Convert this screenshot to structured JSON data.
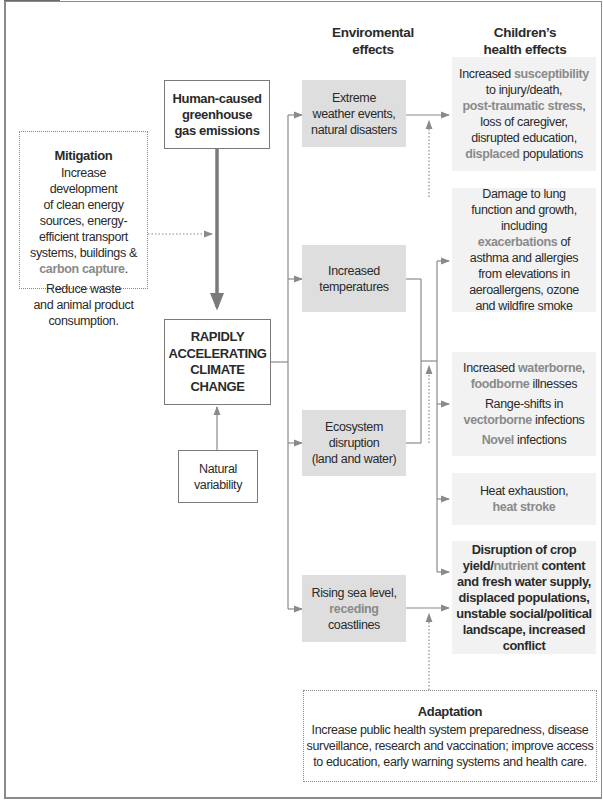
{
  "columns": {
    "environmental": "Enviromental effects",
    "environmental_lines": [
      "Enviromental",
      "effects"
    ],
    "health_lines": [
      "Children’s",
      "health effects"
    ]
  },
  "sources": {
    "human": [
      "Human-caused",
      "greenhouse",
      "gas emissions"
    ],
    "climate": [
      "RAPIDLY",
      "ACCELERATING",
      "CLIMATE",
      "CHANGE"
    ],
    "natural": [
      "Natural",
      "variability"
    ]
  },
  "mitigation": {
    "title": "Mitigation",
    "lines": [
      "Increase",
      "development",
      "of clean energy",
      "sources, energy-",
      "efficient transport",
      "systems, buildings &"
    ],
    "highlight": "carbon capture",
    "highlight_suffix": ".",
    "lines2": [
      "Reduce waste",
      "and animal product",
      "consumption."
    ]
  },
  "environmental_effects": [
    {
      "lines": [
        "Extreme",
        "weather events,",
        "natural disasters"
      ]
    },
    {
      "lines": [
        "Increased",
        "temperatures"
      ]
    },
    {
      "lines": [
        "Ecosystem",
        "disruption",
        "(land and water)"
      ]
    },
    {
      "line1": "Rising sea level,",
      "highlight": "receding",
      "line3": "coastlines"
    }
  ],
  "health_effects": {
    "injury": {
      "p1": "Increased ",
      "h1": "susceptibility",
      "p2": "to injury/death,",
      "h2": "post-traumatic stress",
      "p3": ",",
      "p4": "loss of caregiver,",
      "p5": "disrupted education,",
      "h3": "displaced",
      "p6": " populations"
    },
    "lung": {
      "lines_a": [
        "Damage to lung",
        "function and growth,",
        "including"
      ],
      "highlight": "exacerbations",
      "suffix": " of",
      "lines_b": [
        "asthma and allergies",
        "from elevations in",
        "aeroallergens, ozone",
        "and wildfire smoke"
      ]
    },
    "infection": {
      "p1": "Increased ",
      "h1": "waterborne",
      "p1b": ",",
      "h2": "foodborne",
      "p2": " illnesses",
      "p3": "Range-shifts in",
      "h3": "vectorborne",
      "p4": " infections",
      "h4": "Novel",
      "p5": " infections"
    },
    "heat": {
      "p1": "Heat exhaustion,",
      "h1": "heat stroke"
    },
    "crop": {
      "p1": "Disruption of crop",
      "p2a": "yield/",
      "h1": "nutrient",
      "p2b": " content",
      "lines": [
        "and fresh water supply,",
        "displaced populations,",
        "unstable social/political",
        "landscape, increased",
        "conflict"
      ]
    }
  },
  "adaptation": {
    "title": "Adaptation",
    "lines": [
      "Increase public health system preparedness, disease",
      "surveillance, research and vaccination; improve access",
      "to education, early warning systems and health care."
    ]
  },
  "colors": {
    "env_box": "#dedede",
    "health_box": "#f2f2f2",
    "highlight_text": "#8a8a8a",
    "connector": "#8a8a8a"
  }
}
